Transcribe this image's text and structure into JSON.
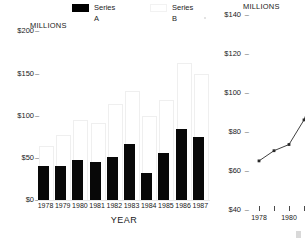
{
  "legend": {
    "items": [
      {
        "label": "Series A",
        "swatch": "black-filled-swatch",
        "color": "#000000",
        "left": 0
      },
      {
        "label": "Series B",
        "swatch": "white-outline-swatch",
        "color": "#ffffff",
        "left": 78
      }
    ]
  },
  "chart_data": [
    {
      "id": "bar-chart",
      "type": "bar",
      "title": "",
      "unit_label": "MILLIONS",
      "xlabel": "YEAR",
      "ylabel": "",
      "categories": [
        "1978",
        "1979",
        "1980",
        "1981",
        "1982",
        "1983",
        "1984",
        "1985",
        "1986",
        "1987"
      ],
      "ylim": [
        0,
        200
      ],
      "yticks": [
        "$0",
        "$50",
        "$100",
        "$150",
        "$200"
      ],
      "ytick_values": [
        0,
        50,
        100,
        150,
        200
      ],
      "grid": false,
      "legend_position": "top",
      "series": [
        {
          "name": "Series A",
          "color": "#000000",
          "values": [
            38,
            38,
            45,
            42,
            48,
            62,
            30,
            52,
            78,
            70,
            80
          ]
        },
        {
          "name": "Series B",
          "color": "#ffffff",
          "values": [
            60,
            72,
            88,
            85,
            105,
            120,
            92,
            110,
            150,
            138,
            155
          ]
        }
      ]
    },
    {
      "id": "line-chart",
      "type": "line",
      "title": "",
      "unit_label": "MILLIONS",
      "xlabel": "",
      "ylabel": "",
      "ylim": [
        40,
        140
      ],
      "yticks": [
        "$40",
        "$60",
        "$80",
        "$100",
        "$120",
        "$140"
      ],
      "ytick_values": [
        40,
        60,
        80,
        100,
        120,
        140
      ],
      "xticks": [
        "1978",
        "",
        "1980",
        "",
        ""
      ],
      "grid": false,
      "marker": "square",
      "series": [
        {
          "name": "Series",
          "color": "#2a2a2a",
          "x": [
            "1978",
            "1979",
            "1980",
            "1981",
            "1982"
          ],
          "values": [
            62,
            67,
            70,
            82,
            102
          ]
        }
      ]
    }
  ]
}
